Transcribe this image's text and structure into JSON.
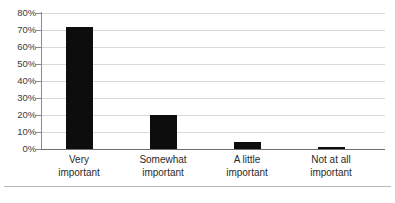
{
  "chart_data": {
    "type": "bar",
    "title": "",
    "subtitle": "",
    "xlabel": "",
    "ylabel": "",
    "categories": [
      "Very important",
      "Somewhat important",
      "A little important",
      "Not at all important"
    ],
    "category_lines": [
      [
        "Very",
        "important"
      ],
      [
        "Somewhat",
        "important"
      ],
      [
        "A little",
        "important"
      ],
      [
        "Not at all",
        "important"
      ]
    ],
    "values": [
      72,
      20,
      4,
      1
    ],
    "value_labels": [
      "72%",
      "20%",
      "4%",
      "1%"
    ],
    "ylim": [
      0,
      80
    ],
    "ytick_values": [
      0,
      10,
      20,
      30,
      40,
      50,
      60,
      70,
      80
    ],
    "ytick_labels": [
      "0%",
      "10%",
      "20%",
      "30%",
      "40%",
      "50%",
      "60%",
      "70%",
      "80%"
    ],
    "grid": true,
    "legend": null,
    "legend_position": "none",
    "bar_color": "#0d0d0d",
    "gridline_color": "#d9d9d9",
    "axis_color": "#8a8a8a",
    "background_color": "#ffffff"
  }
}
